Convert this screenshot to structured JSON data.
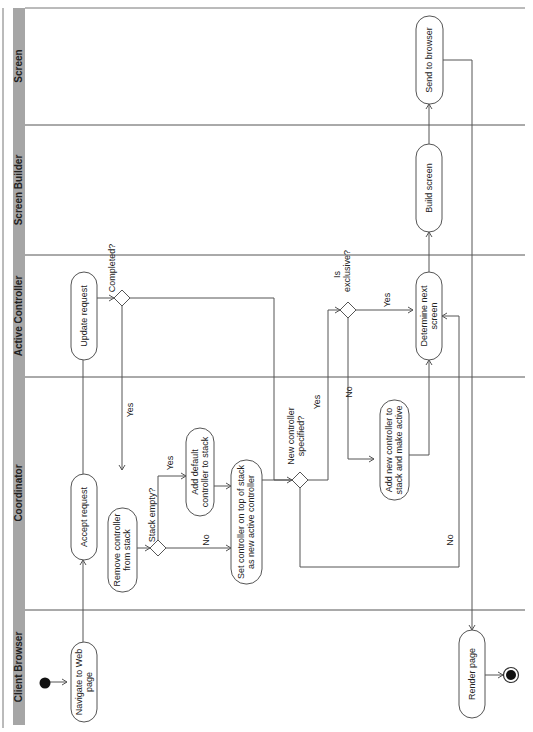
{
  "diagram": {
    "type": "UML activity diagram (swimlanes, rotated 90° counter-clockwise)",
    "lanes": [
      {
        "id": "screen",
        "label": "Screen"
      },
      {
        "id": "screen_builder",
        "label": "Screen Builder"
      },
      {
        "id": "active_controller",
        "label": "Active Controller"
      },
      {
        "id": "coordinator",
        "label": "Coordinator"
      },
      {
        "id": "client_browser",
        "label": "Client Browser"
      }
    ],
    "nodes": {
      "start": {
        "label": "Start"
      },
      "navigate": {
        "line1": "Navigate to Web",
        "line2": "page"
      },
      "accept": {
        "line1": "Accept request"
      },
      "update": {
        "line1": "Update request"
      },
      "completed": {
        "label": "Completed?"
      },
      "remove": {
        "line1": "Remove controller",
        "line2": "from stack"
      },
      "stack_empty": {
        "label": "Stack empty?"
      },
      "add_default": {
        "line1": "Add default",
        "line2": "controller to stack"
      },
      "set_top": {
        "line1": "Set controller on top of stack",
        "line2": "as new active controller"
      },
      "new_specified": {
        "line1": "New controller",
        "line2": "specified?"
      },
      "is_exclusive": {
        "line1": "Is",
        "line2": "exclusive?"
      },
      "add_new": {
        "line1": "Add new controller to",
        "line2": "stack and make active"
      },
      "determine": {
        "line1": "Determine next",
        "line2": "screen"
      },
      "build": {
        "line1": "Build screen"
      },
      "send": {
        "line1": "Send to browser"
      },
      "render": {
        "line1": "Render page"
      },
      "end": {
        "label": "End"
      }
    },
    "guards": {
      "completed_yes": "Yes",
      "stack_empty_yes": "Yes",
      "stack_empty_no": "No",
      "new_specified_yes": "Yes",
      "new_specified_no": "No",
      "is_exclusive_yes": "Yes",
      "is_exclusive_no": "No"
    },
    "colors": {
      "header": "#a6a6a6",
      "stroke": "#555555",
      "background": "#ffffff"
    }
  }
}
